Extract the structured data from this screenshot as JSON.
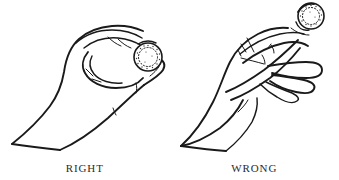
{
  "figure": {
    "name": "coin-holding-technique-diagram",
    "background_color": "#ffffff",
    "ink_color": "#1a1a1a",
    "text_color": "#2b2b2b",
    "width": 339,
    "height": 180
  },
  "panels": [
    {
      "id": "right-panel",
      "caption": "RIGHT",
      "subject": "hand-holding-coin-correct",
      "coin": {
        "name": "coin",
        "shape": "circle",
        "edge": "milled-stippled",
        "center_x": 148,
        "center_y": 57,
        "radius": 14
      }
    },
    {
      "id": "wrong-panel",
      "caption": "WRONG",
      "subject": "hand-holding-coin-incorrect",
      "coin": {
        "name": "coin",
        "shape": "circle",
        "edge": "milled-stippled",
        "center_x": 311,
        "center_y": 16,
        "radius": 13
      }
    }
  ]
}
